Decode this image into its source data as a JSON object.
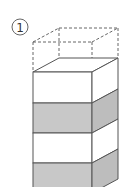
{
  "figure": {
    "label": "1",
    "colors": {
      "stroke": "#555555",
      "dashed_stroke": "#666666",
      "white_face": "#ffffff",
      "gray_front": "#c8c8c8",
      "gray_side": "#bdbdbd"
    },
    "layers": [
      {
        "index": 0,
        "fill": "white",
        "label": ""
      },
      {
        "index": 1,
        "fill": "gray",
        "label": ""
      },
      {
        "index": 2,
        "fill": "white",
        "label": ""
      },
      {
        "index": 3,
        "fill": "gray",
        "label": ""
      }
    ],
    "dashed_top_block": true
  }
}
